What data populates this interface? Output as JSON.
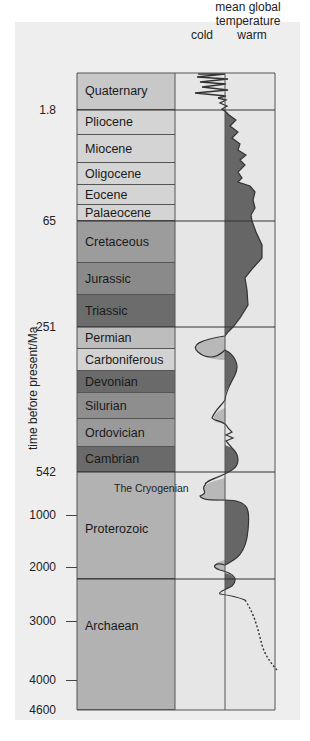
{
  "header": {
    "line1": "mean global",
    "line2": "temperature",
    "cold": "cold",
    "warm": "warm"
  },
  "y_axis_label": "time before present/Ma",
  "ticks": [
    {
      "label": "1.8",
      "y": 110
    },
    {
      "label": "65",
      "y": 221
    },
    {
      "label": "251",
      "y": 327
    },
    {
      "label": "542",
      "y": 472
    },
    {
      "label": "1000",
      "y": 515
    },
    {
      "label": "2000",
      "y": 567
    },
    {
      "label": "3000",
      "y": 621
    },
    {
      "label": "4000",
      "y": 680
    },
    {
      "label": "4600",
      "y": 710
    }
  ],
  "periods": [
    {
      "name": "Quaternary",
      "top": 73,
      "bottom": 110,
      "color": "#c8c8c8"
    },
    {
      "name": "Pliocene",
      "top": 110,
      "bottom": 135,
      "color": "#d4d4d4"
    },
    {
      "name": "Miocene",
      "top": 135,
      "bottom": 163,
      "color": "#d4d4d4"
    },
    {
      "name": "Oligocene",
      "top": 163,
      "bottom": 185,
      "color": "#d4d4d4"
    },
    {
      "name": "Eocene",
      "top": 185,
      "bottom": 205,
      "color": "#d4d4d4"
    },
    {
      "name": "Palaeocene",
      "top": 205,
      "bottom": 221,
      "color": "#d4d4d4"
    },
    {
      "name": "Cretaceous",
      "top": 221,
      "bottom": 263,
      "color": "#9c9c9c"
    },
    {
      "name": "Jurassic",
      "top": 263,
      "bottom": 295,
      "color": "#8a8a8a"
    },
    {
      "name": "Triassic",
      "top": 295,
      "bottom": 327,
      "color": "#6c6c6c"
    },
    {
      "name": "Permian",
      "top": 327,
      "bottom": 349,
      "color": "#bdbdbd"
    },
    {
      "name": "Carboniferous",
      "top": 349,
      "bottom": 371,
      "color": "#d2d2d2"
    },
    {
      "name": "Devonian",
      "top": 371,
      "bottom": 393,
      "color": "#6a6a6a"
    },
    {
      "name": "Silurian",
      "top": 393,
      "bottom": 419,
      "color": "#8e8e8e"
    },
    {
      "name": "Ordovician",
      "top": 419,
      "bottom": 447,
      "color": "#9a9a9a"
    },
    {
      "name": "Cambrian",
      "top": 447,
      "bottom": 472,
      "color": "#6a6a6a"
    },
    {
      "name": "Proterozoic",
      "top": 472,
      "bottom": 579,
      "color": "#b2b2b2",
      "label_offset": 50
    },
    {
      "name": "Archaean",
      "top": 579,
      "bottom": 710,
      "color": "#b2b2b2",
      "label_offset": 40
    }
  ],
  "annotations": {
    "cryogenian": "The Cryogenian"
  },
  "colors": {
    "panel_bg": "#eeeeee",
    "temp_column_bg": "#e6e6e6",
    "warm_fill": "#666666",
    "cold_fill": "#b8b8b8",
    "line": "#333333"
  }
}
